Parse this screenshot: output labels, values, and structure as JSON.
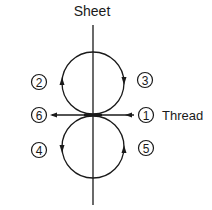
{
  "diagram": {
    "title": "Sheet",
    "thread_label": "Thread",
    "steps": [
      {
        "id": "1",
        "glyph": "1",
        "position": "right-center"
      },
      {
        "id": "2",
        "glyph": "2",
        "position": "upper-left"
      },
      {
        "id": "3",
        "glyph": "3",
        "position": "upper-right"
      },
      {
        "id": "4",
        "glyph": "4",
        "position": "lower-left"
      },
      {
        "id": "5",
        "glyph": "5",
        "position": "lower-right"
      },
      {
        "id": "6",
        "glyph": "6",
        "position": "left-center"
      }
    ],
    "colors": {
      "stroke": "#1a1a1a",
      "background": "#ffffff"
    }
  }
}
